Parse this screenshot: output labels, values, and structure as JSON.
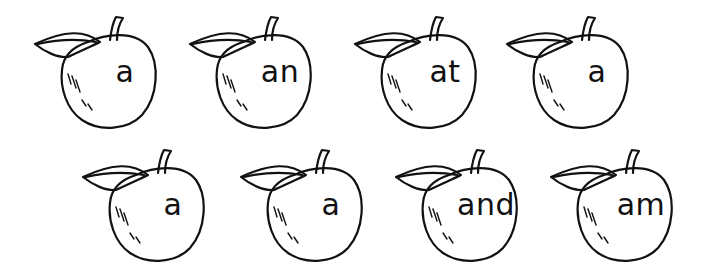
{
  "worksheet": {
    "rows": [
      {
        "apples": [
          {
            "word": "a"
          },
          {
            "word": "an"
          },
          {
            "word": "at"
          },
          {
            "word": "a"
          }
        ]
      },
      {
        "apples": [
          {
            "word": "a"
          },
          {
            "word": "a"
          },
          {
            "word": "and"
          },
          {
            "word": "am"
          }
        ]
      }
    ],
    "colors": {
      "outline": "#111111",
      "background": "#ffffff"
    }
  }
}
